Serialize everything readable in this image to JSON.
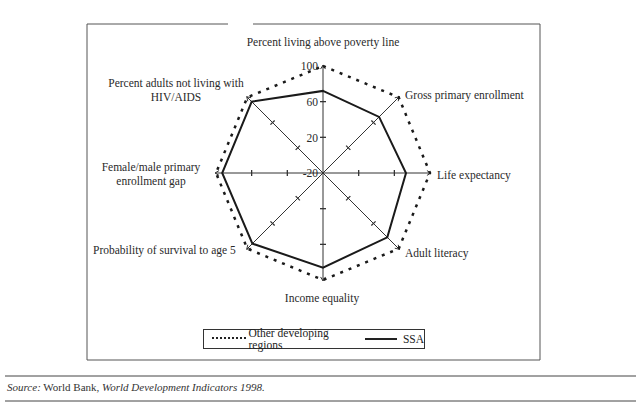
{
  "chart_data": {
    "type": "radar",
    "title": "",
    "center": [
      323,
      173
    ],
    "scale": {
      "min": -20,
      "max": 100,
      "ticks": [
        -20,
        20,
        60,
        100
      ],
      "px_per_unit": 0.892
    },
    "axes": [
      "Percent living above poverty line",
      "Gross primary enrollment",
      "Life expectancy",
      "Adult literacy",
      "Income equality",
      "Probability of survival to age 5",
      "Female/male primary enrollment gap",
      "Percent adults not living with HIV/AIDS"
    ],
    "series": [
      {
        "name": "Other developing regions",
        "style": "dotted",
        "values": [
          100,
          100,
          100,
          100,
          100,
          100,
          100,
          100
        ]
      },
      {
        "name": "SSA",
        "style": "solid",
        "values": [
          72,
          69,
          73,
          82,
          86,
          92,
          93,
          93
        ]
      }
    ],
    "legend_position": "bottom",
    "grid": false
  },
  "labels": {
    "axis_top": "Percent living above poverty line",
    "axis_upper_right": "Gross primary enrollment",
    "axis_right": "Life expectancy",
    "axis_lower_right": "Adult literacy",
    "axis_bottom": "Income equality",
    "axis_lower_left": "Probability of survival to age 5",
    "axis_left_line1": "Female/male primary",
    "axis_left_line2": "enrollment gap",
    "axis_upper_left_line1": "Percent adults not living with",
    "axis_upper_left_line2": "HIV/AIDS",
    "tick_100": "100",
    "tick_60": "60",
    "tick_20": "20",
    "tick_m20": "-20"
  },
  "legend": {
    "other": "Other developing regions",
    "ssa": "SSA"
  },
  "source": {
    "prefix": "Source:",
    "text": " World Bank, ",
    "title": "World Development Indicators 1998."
  }
}
